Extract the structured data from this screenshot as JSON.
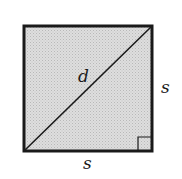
{
  "diagram": {
    "shape": "square",
    "fill_color": "#d4d4d4",
    "stroke_color": "#1a1a1a",
    "labels": {
      "diagonal": "d",
      "right_side": "s",
      "bottom_side": "s"
    },
    "right_angle_marker": "bottom-right"
  }
}
